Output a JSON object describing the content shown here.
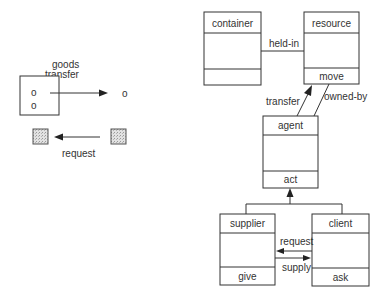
{
  "left_diagram": {
    "goods_transfer": {
      "label_line1": "goods",
      "label_line2": "transfer",
      "source_items": [
        "o",
        "o"
      ],
      "target_item": "o"
    },
    "request": {
      "label": "request"
    }
  },
  "classes": {
    "container": {
      "name": "container",
      "operation": ""
    },
    "resource": {
      "name": "resource",
      "operation": "move"
    },
    "agent": {
      "name": "agent",
      "operation": "act"
    },
    "supplier": {
      "name": "supplier",
      "operation": "give"
    },
    "client": {
      "name": "client",
      "operation": "ask"
    }
  },
  "relations": {
    "held_in": "held-in",
    "transfer": "transfer",
    "owned_by": "owned-by",
    "request": "request",
    "supply": "supply"
  },
  "colors": {
    "line": "#333333",
    "stipple_fill": "#d6d6d6",
    "background": "#ffffff"
  }
}
